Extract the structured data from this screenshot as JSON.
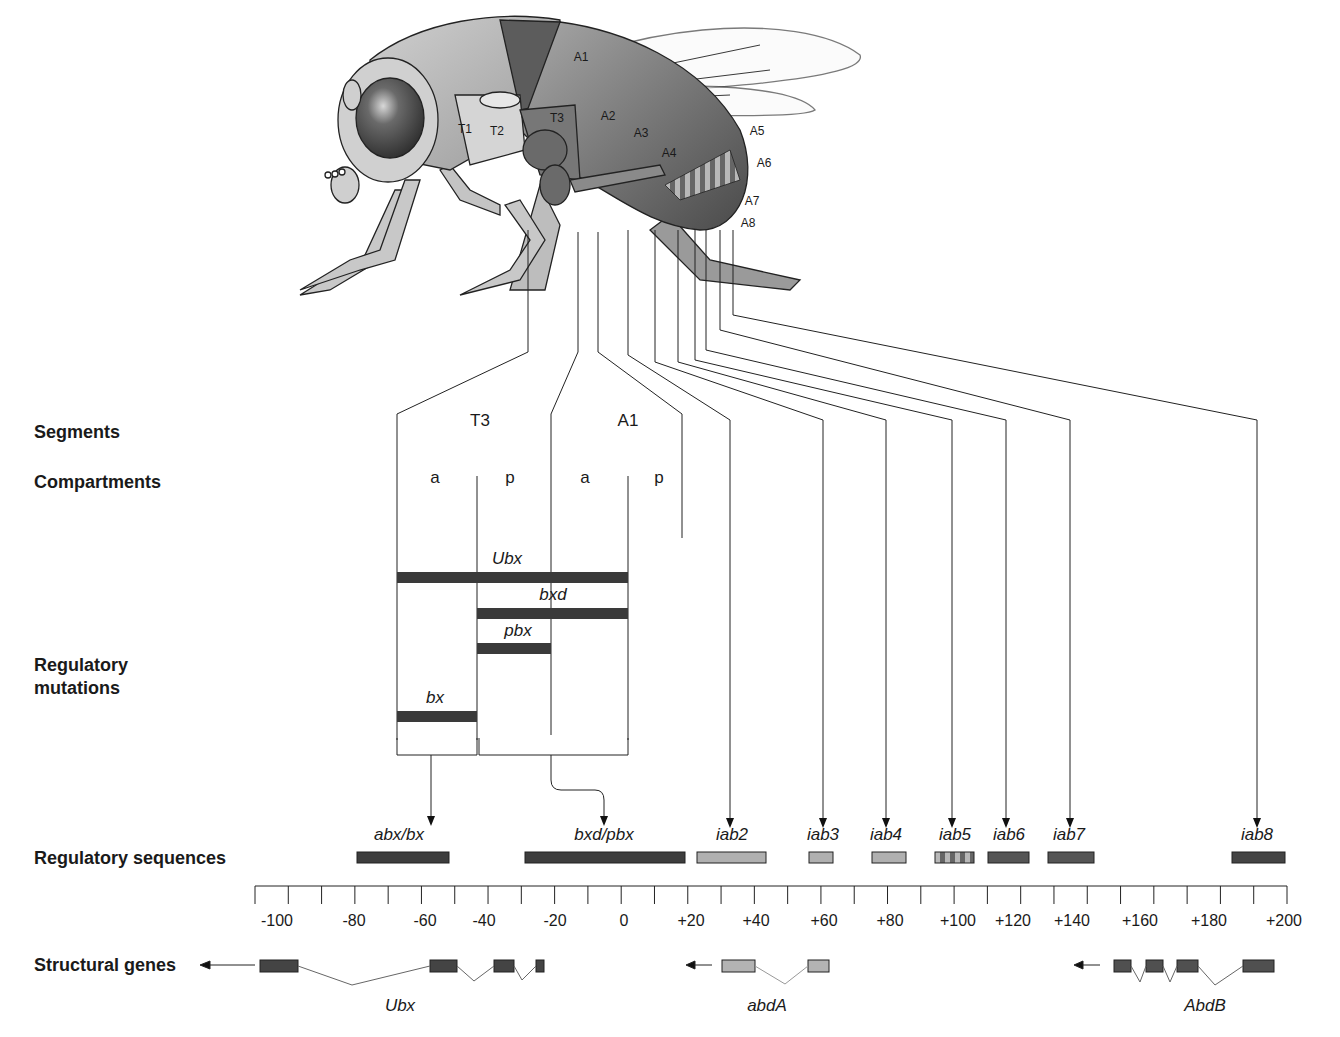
{
  "fly": {
    "segment_labels": [
      "T1",
      "T2",
      "T3",
      "A1",
      "A2",
      "A3",
      "A4",
      "A5",
      "A6",
      "A7",
      "A8"
    ]
  },
  "row_labels": {
    "segments": "Segments",
    "compartments": "Compartments",
    "regulatory_mutations_1": "Regulatory",
    "regulatory_mutations_2": "mutations",
    "regulatory_sequences": "Regulatory sequences",
    "structural_genes": "Structural genes"
  },
  "segments": {
    "t3": "T3",
    "a1": "A1"
  },
  "compartments": [
    "a",
    "p",
    "a",
    "p"
  ],
  "mutations": [
    {
      "name": "Ubx"
    },
    {
      "name": "bxd"
    },
    {
      "name": "pbx"
    },
    {
      "name": "bx"
    }
  ],
  "regulatory_sequences": [
    {
      "name": "abx/bx",
      "start": -78,
      "end": -52,
      "color": "#3d3d3d"
    },
    {
      "name": "bxd/pbx",
      "start": -27,
      "end": 18,
      "color": "#3d3d3d"
    },
    {
      "name": "iab2",
      "start": 22,
      "end": 42,
      "color": "#b0b0b0"
    },
    {
      "name": "iab3",
      "start": 54,
      "end": 61,
      "color": "#b0b0b0"
    },
    {
      "name": "iab4",
      "start": 71,
      "end": 81,
      "color": "#b0b0b0"
    },
    {
      "name": "iab5",
      "start": 93,
      "end": 105,
      "color": "striped"
    },
    {
      "name": "iab6",
      "start": 110,
      "end": 122,
      "color": "#555555"
    },
    {
      "name": "iab7",
      "start": 128,
      "end": 142,
      "color": "#555555"
    },
    {
      "name": "iab8",
      "start": 185,
      "end": 200,
      "color": "#444444"
    }
  ],
  "axis": {
    "min": -110,
    "max": 200,
    "labels": [
      "-100",
      "-80",
      "-60",
      "-40",
      "-20",
      "0",
      "+20",
      "+40",
      "+60",
      "+80",
      "+100",
      "+120",
      "+140",
      "+160",
      "+180",
      "+200"
    ]
  },
  "structural_genes": [
    {
      "name": "Ubx",
      "color": "#444444"
    },
    {
      "name": "abdA",
      "color": "#b3b3b3"
    },
    {
      "name": "AbdB",
      "color": "#505050"
    }
  ]
}
